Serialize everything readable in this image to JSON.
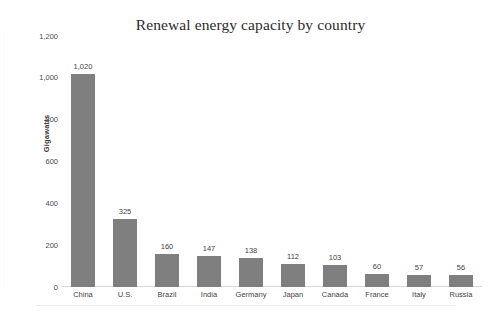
{
  "chart_data": {
    "type": "bar",
    "title": "Renewal energy capacity by country",
    "xlabel": "",
    "ylabel": "Gigawatts",
    "categories": [
      "China",
      "U.S.",
      "Brazil",
      "India",
      "Germany",
      "Japan",
      "Canada",
      "France",
      "Italy",
      "Russia"
    ],
    "values": [
      1020,
      325,
      160,
      147,
      138,
      112,
      103,
      60,
      57,
      56
    ],
    "value_labels": [
      "1,020",
      "325",
      "160",
      "147",
      "138",
      "112",
      "103",
      "60",
      "57",
      "56"
    ],
    "ylim": [
      0,
      1200
    ],
    "ytick_values": [
      0,
      200,
      400,
      600,
      800,
      1000,
      1200
    ],
    "ytick_labels": [
      "0",
      "200",
      "400",
      "600",
      "800",
      "1,000",
      "1,200"
    ],
    "grid": false,
    "legend": false,
    "legend_position": "none",
    "bar_color": "#7f7f7f",
    "background_color": "#ffffff",
    "text_color": "#3f3f3f",
    "data_labels_shown": true
  }
}
